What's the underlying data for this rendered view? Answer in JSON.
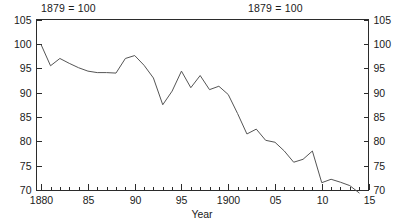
{
  "figure": {
    "note_left": "1879 = 100",
    "note_right": "1879 = 100"
  },
  "chart_data": {
    "type": "line",
    "title": "",
    "subtitle": "",
    "xlabel": "Year",
    "ylabel": "",
    "annotations": [
      "1879 = 100",
      "1879 = 100"
    ],
    "xlim": [
      1879.5,
      1915
    ],
    "ylim": [
      70,
      105
    ],
    "grid": false,
    "legend": null,
    "y_ticks": [
      70,
      75,
      80,
      85,
      90,
      95,
      100,
      105
    ],
    "y_tick_labels": [
      "70",
      "75",
      "80",
      "85",
      "90",
      "95",
      "100",
      "105"
    ],
    "y_axis_right_ticks": [
      70,
      75,
      80,
      85,
      90,
      95,
      100,
      105
    ],
    "y_axis_right_tick_labels": [
      "70",
      "75",
      "80",
      "85",
      "90",
      "95",
      "100",
      "105"
    ],
    "x_major_ticks": [
      1880,
      1885,
      1890,
      1895,
      1900,
      1905,
      1910,
      1915
    ],
    "x_tick_labels": [
      "1880",
      "85",
      "90",
      "95",
      "1900",
      "05",
      "10",
      "15"
    ],
    "x_minor_tick_step": 1,
    "line_color": "#555555",
    "x": [
      1880,
      1881,
      1882,
      1883,
      1884,
      1885,
      1886,
      1887,
      1888,
      1889,
      1890,
      1891,
      1892,
      1893,
      1894,
      1895,
      1896,
      1897,
      1898,
      1899,
      1900,
      1901,
      1902,
      1903,
      1904,
      1905,
      1906,
      1907,
      1908,
      1909,
      1910,
      1911,
      1912,
      1913,
      1914
    ],
    "values": [
      99.8,
      95.5,
      97.0,
      96.0,
      95.1,
      94.4,
      94.1,
      94.1,
      94.0,
      97.0,
      97.6,
      95.6,
      93.0,
      87.5,
      90.3,
      94.4,
      91.0,
      93.5,
      90.6,
      91.3,
      89.6,
      85.7,
      81.5,
      82.5,
      80.2,
      79.8,
      78.0,
      75.7,
      76.3,
      78.0,
      71.5,
      72.2,
      71.6,
      70.9,
      69.4
    ]
  }
}
